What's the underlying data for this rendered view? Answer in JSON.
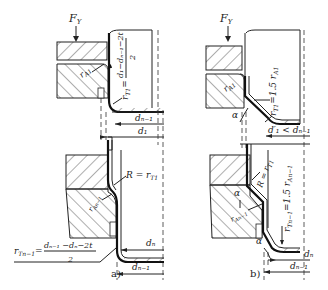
{
  "figure": {
    "panels": [
      {
        "id": "a",
        "caption": "a)",
        "labels": {
          "force": "F",
          "force_sub": "Y",
          "r_a1": "r",
          "r_a1_sub": "A1",
          "r_t1_formula_lhs": "r",
          "r_t1_formula_sub": "T1",
          "r_t1_formula_eq": "=",
          "r_t1_formula_num": "d₁−dₙ₋₁−2t",
          "r_t1_formula_den": "2",
          "d_n_minus_1_top": "dₙ₋₁",
          "d_1": "d₁",
          "R_eq": "R = r",
          "R_eq_sub": "T1",
          "r_an_minus_1": "r",
          "r_an_minus_1_sub": "An−1",
          "d_n": "dₙ",
          "d_n_minus_1_bottom": "dₙ₋₁",
          "r_tn_formula_lhs": "r",
          "r_tn_formula_sub": "Tn−1",
          "r_tn_formula_eq": "=",
          "r_tn_formula_num": "dₙ₋₁ −dₙ−2t",
          "r_tn_formula_den": "2"
        }
      },
      {
        "id": "b",
        "caption": "b)",
        "labels": {
          "force": "F",
          "force_sub": "Y",
          "r_a1": "r",
          "r_a1_sub": "A1",
          "r_t1": "r",
          "r_t1_sub": "T1",
          "r_t1_eq": "=1.5 r",
          "r_t1_eq_sub": "A1",
          "alpha_top": "α",
          "d1_prime": "d′₁ < dₙ₋₁",
          "R_eq": "R = r",
          "R_eq_sub": "T1",
          "alpha_mid": "α",
          "r_an_minus_1": "r",
          "r_an_minus_1_sub": "An−1",
          "r_tn": "r",
          "r_tn_sub": "Tn−1",
          "r_tn_eq": "=1.5 r",
          "r_tn_eq_sub": "An−1",
          "alpha_bottom": "α",
          "d_n": "dₙ",
          "d_n_minus_1": "dₙ₋₁"
        }
      }
    ]
  }
}
